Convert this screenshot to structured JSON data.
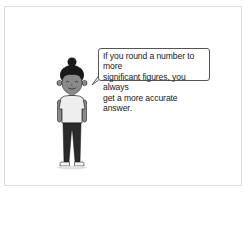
{
  "scene": {
    "speech_bubble": {
      "lines": [
        "If you round a number to more",
        "significant figures, you always",
        "get a more accurate answer."
      ]
    },
    "character": {
      "description": "cartoon person with hair bun, grey skin tone, white t-shirt, dark trousers"
    },
    "colors": {
      "frame_border": "#dcdcdc",
      "bubble_border": "#555555",
      "skin": "#8a8a8a",
      "hair": "#1a1a1a",
      "shirt": "#eeeeee",
      "trousers": "#2a2a2a"
    }
  }
}
